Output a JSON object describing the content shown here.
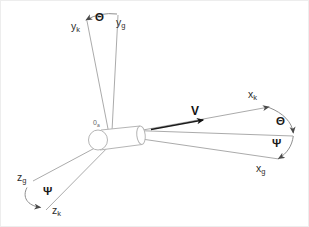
{
  "figure": {
    "type": "axes-diagram",
    "background": "#ffffff",
    "line_color": "#ababab",
    "label_color": "#2e2e2e",
    "accent_color": "#111111"
  },
  "labels": {
    "y_body": {
      "main": "y",
      "sub": "k"
    },
    "y_ground": {
      "main": "y",
      "sub": "g"
    },
    "x_body": {
      "main": "x",
      "sub": "k"
    },
    "x_ground": {
      "main": "x",
      "sub": "g"
    },
    "z_body": {
      "main": "z",
      "sub": "k"
    },
    "z_ground": {
      "main": "z",
      "sub": "g"
    },
    "origin": {
      "main": "0",
      "sub": "a"
    },
    "velocity": "V",
    "theta": "Θ",
    "psi": "Ψ"
  }
}
